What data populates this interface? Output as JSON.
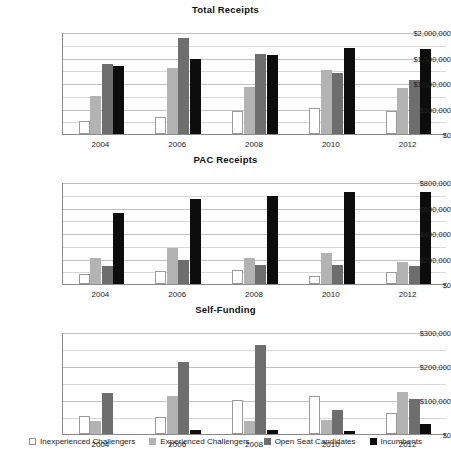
{
  "legend": {
    "items": [
      {
        "label": "Inexperienced Challengers",
        "color": "#ffffff",
        "swatch": "sw0"
      },
      {
        "label": "Experienced Challengers",
        "color": "#b3b3b3",
        "swatch": "sw1"
      },
      {
        "label": "Open Seat Candidates",
        "color": "#6e6e6e",
        "swatch": "sw2"
      },
      {
        "label": "Incumbents",
        "color": "#0d0d0d",
        "swatch": "sw3"
      }
    ]
  },
  "chart_data": [
    {
      "type": "bar",
      "title": "Total Receipts",
      "xlabel": "",
      "ylabel": "",
      "categories": [
        "2004",
        "2006",
        "2008",
        "2010",
        "2012"
      ],
      "ylim": [
        0,
        2000000
      ],
      "yticks": [
        0,
        500000,
        1000000,
        1500000,
        2000000
      ],
      "ytick_labels": [
        "$0",
        "$500,000",
        "$1,000,000",
        "$1,500,000",
        "$2,000,000"
      ],
      "minor_gridlines": true,
      "minor_step": 250000,
      "grid": true,
      "legend_position": "bottom-shared",
      "series": [
        {
          "name": "Inexperienced Challengers",
          "color": "#ffffff",
          "values": [
            250000,
            335000,
            455000,
            510000,
            460000
          ]
        },
        {
          "name": "Experienced Challengers",
          "color": "#b3b3b3",
          "values": [
            750000,
            1300000,
            920000,
            1250000,
            900000
          ]
        },
        {
          "name": "Open Seat Candidates",
          "color": "#6e6e6e",
          "values": [
            1380000,
            1880000,
            1575000,
            1190000,
            1060000
          ]
        },
        {
          "name": "Incumbents",
          "color": "#0d0d0d",
          "values": [
            1330000,
            1475000,
            1550000,
            1680000,
            1670000
          ]
        }
      ]
    },
    {
      "type": "bar",
      "title": "PAC Receipts",
      "xlabel": "",
      "ylabel": "",
      "categories": [
        "2004",
        "2006",
        "2008",
        "2010",
        "2012"
      ],
      "ylim": [
        0,
        800000
      ],
      "yticks": [
        0,
        200000,
        400000,
        600000,
        800000
      ],
      "ytick_labels": [
        "$0",
        "$200,000",
        "$400,000",
        "$600,000",
        "$800,000"
      ],
      "minor_gridlines": true,
      "minor_step": 100000,
      "grid": true,
      "legend_position": "bottom-shared",
      "series": [
        {
          "name": "Inexperienced Challengers",
          "color": "#ffffff",
          "values": [
            75000,
            100000,
            110000,
            65000,
            98000
          ]
        },
        {
          "name": "Experienced Challengers",
          "color": "#b3b3b3",
          "values": [
            202000,
            282000,
            203000,
            245000,
            172000
          ]
        },
        {
          "name": "Open Seat Candidates",
          "color": "#6e6e6e",
          "values": [
            140000,
            192000,
            152000,
            150000,
            138000
          ]
        },
        {
          "name": "Incumbents",
          "color": "#0d0d0d",
          "values": [
            560000,
            665000,
            692000,
            722000,
            718000
          ]
        }
      ]
    },
    {
      "type": "bar",
      "title": "Self-Funding",
      "xlabel": "",
      "ylabel": "",
      "categories": [
        "2004",
        "2006",
        "2008",
        "2010",
        "2012"
      ],
      "ylim": [
        0,
        300000
      ],
      "yticks": [
        0,
        100000,
        200000,
        300000
      ],
      "ytick_labels": [
        "$0",
        "$100,000",
        "$200,000",
        "$300,000"
      ],
      "minor_gridlines": true,
      "minor_step": 50000,
      "grid": true,
      "legend_position": "bottom-shared",
      "series": [
        {
          "name": "Inexperienced Challengers",
          "color": "#ffffff",
          "values": [
            52000,
            51000,
            101000,
            113000,
            63000
          ]
        },
        {
          "name": "Experienced Challengers",
          "color": "#b3b3b3",
          "values": [
            37000,
            113000,
            37000,
            40000,
            123000
          ]
        },
        {
          "name": "Open Seat Candidates",
          "color": "#6e6e6e",
          "values": [
            120000,
            212000,
            263000,
            72000,
            103000
          ]
        },
        {
          "name": "Incumbents",
          "color": "#0d0d0d",
          "values": [
            0,
            11000,
            12000,
            8000,
            30000
          ]
        }
      ]
    }
  ]
}
